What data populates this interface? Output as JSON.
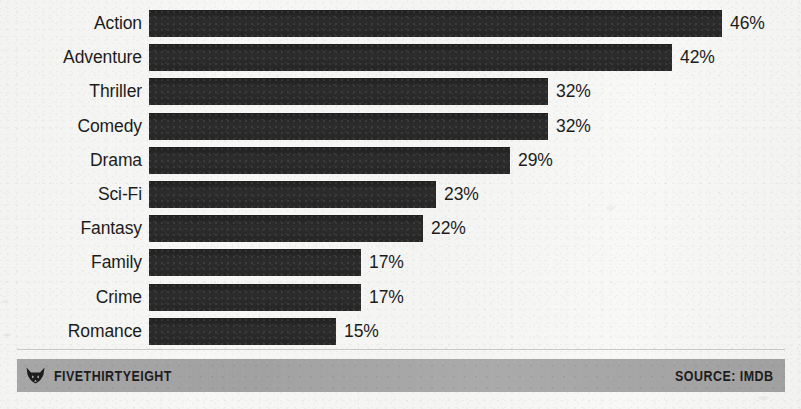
{
  "chart_data": {
    "type": "bar",
    "orientation": "horizontal",
    "title": "",
    "subtitle": "",
    "xlabel": "",
    "ylabel": "",
    "grid": false,
    "legend": null,
    "xlim": [
      0,
      46
    ],
    "value_suffix": "%",
    "categories": [
      "Action",
      "Adventure",
      "Thriller",
      "Comedy",
      "Drama",
      "Sci-Fi",
      "Fantasy",
      "Family",
      "Crime",
      "Romance"
    ],
    "values": [
      46,
      42,
      32,
      32,
      29,
      23,
      22,
      17,
      17,
      15
    ],
    "value_labels": [
      "46%",
      "42%",
      "32%",
      "32%",
      "29%",
      "23%",
      "22%",
      "17%",
      "17%",
      "15%"
    ],
    "bars": [
      {
        "label": "Action",
        "value": 46,
        "value_label": "46%"
      },
      {
        "label": "Adventure",
        "value": 42,
        "value_label": "42%"
      },
      {
        "label": "Thriller",
        "value": 32,
        "value_label": "32%"
      },
      {
        "label": "Comedy",
        "value": 32,
        "value_label": "32%"
      },
      {
        "label": "Drama",
        "value": 29,
        "value_label": "29%"
      },
      {
        "label": "Sci-Fi",
        "value": 23,
        "value_label": "23%"
      },
      {
        "label": "Fantasy",
        "value": 22,
        "value_label": "22%"
      },
      {
        "label": "Family",
        "value": 17,
        "value_label": "17%"
      },
      {
        "label": "Crime",
        "value": 17,
        "value_label": "17%"
      },
      {
        "label": "Romance",
        "value": 15,
        "value_label": "15%"
      }
    ],
    "colors": {
      "bar": "#272727",
      "text": "#1c1c1c",
      "background": "#f5f5f3",
      "footer_bar": "#a5a5a5"
    }
  },
  "footer": {
    "brand": "FIVETHIRTYEIGHT",
    "logo_icon": "fox-head-icon",
    "source": "SOURCE: IMDB"
  }
}
